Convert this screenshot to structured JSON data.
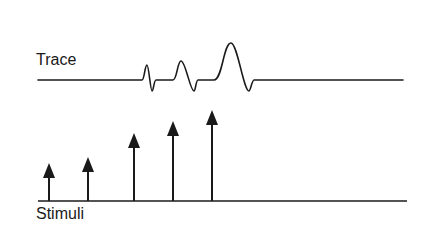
{
  "labels": {
    "trace": "Trace",
    "stimuli": "Stimuli"
  },
  "colors": {
    "line": "#1a1a1a",
    "background": "#ffffff"
  },
  "trace": {
    "baseline_y": 80,
    "x_start": 38,
    "x_end": 403,
    "spikes": [
      {
        "start": 142,
        "peak_x": 147,
        "peak_y": 65,
        "trough_x": 152,
        "trough_y": 91,
        "end": 156
      },
      {
        "start": 173,
        "peak_x": 181,
        "peak_y": 61,
        "trough_x": 194,
        "trough_y": 91,
        "end": 198
      },
      {
        "start": 214,
        "peak_x": 231,
        "peak_y": 43,
        "trough_x": 249,
        "trough_y": 91,
        "end": 254
      }
    ]
  },
  "stimuli": {
    "baseline_y": 201,
    "x_start": 38,
    "x_end": 407,
    "arrows": [
      {
        "x": 49,
        "tip_y": 163
      },
      {
        "x": 88,
        "tip_y": 157
      },
      {
        "x": 134,
        "tip_y": 133
      },
      {
        "x": 173,
        "tip_y": 121
      },
      {
        "x": 212,
        "tip_y": 110
      }
    ]
  }
}
